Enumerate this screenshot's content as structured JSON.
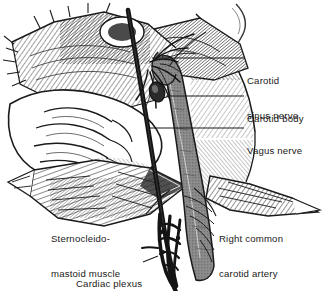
{
  "figure": {
    "background_color": "#ffffff",
    "ink_color": "#1a1a1a",
    "artery_fill": "#8c8c8c",
    "style": "pen-and-ink hatched medical illustration"
  },
  "labels": {
    "carotid_sinus_nerve": {
      "line1": "Carotid",
      "line2": "sinus nerve"
    },
    "carotid_body": {
      "text": "Carotid body"
    },
    "vagus_nerve": {
      "text": "Vagus nerve"
    },
    "right_common_carotid_artery": {
      "line1": "Right common",
      "line2": "carotid artery"
    },
    "sternocleidomastoid_muscle": {
      "line1": "Sternocleido-",
      "line2": "mastoid muscle"
    },
    "cardiac_plexus": {
      "text": "Cardiac plexus"
    }
  },
  "structures": [
    {
      "name": "carotid-sinus-nerve",
      "kind": "nerve"
    },
    {
      "name": "carotid-body",
      "kind": "glomus"
    },
    {
      "name": "vagus-nerve",
      "kind": "nerve"
    },
    {
      "name": "right-common-carotid-artery",
      "kind": "artery"
    },
    {
      "name": "sternocleidomastoid-muscle",
      "kind": "muscle"
    },
    {
      "name": "cardiac-plexus",
      "kind": "nerve-plexus"
    },
    {
      "name": "retractor-instrument",
      "kind": "instrument"
    },
    {
      "name": "tissue-flap-left",
      "kind": "tissue"
    },
    {
      "name": "tissue-flap-right",
      "kind": "tissue"
    }
  ]
}
